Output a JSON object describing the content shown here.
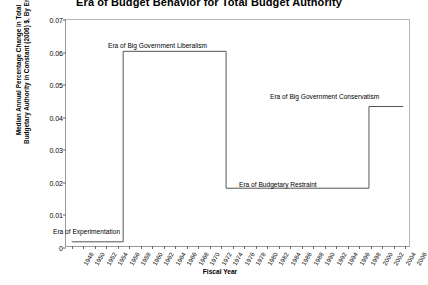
{
  "chart_data": {
    "type": "line",
    "title": "Era of Budget Behavior for Total Budget Authority",
    "xlabel": "Fiscal Year",
    "ylabel": "Median Annual Percentage Change in Total Budgetary Authority in Constant (2006) $, By Era",
    "ylim": [
      0,
      0.07
    ],
    "ytick_labels": [
      "0",
      "0.01",
      "0.02",
      "0.03",
      "0.04",
      "0.05",
      "0.06",
      "0.07"
    ],
    "ytick_values": [
      0,
      0.01,
      0.02,
      0.03,
      0.04,
      0.05,
      0.06,
      0.07
    ],
    "xlim": [
      1947,
      2007
    ],
    "grid": false,
    "legend": "none",
    "line_style": "step",
    "line_color": "#555555",
    "categories": [
      1948,
      1950,
      1952,
      1954,
      1956,
      1958,
      1960,
      1962,
      1964,
      1966,
      1968,
      1970,
      1972,
      1974,
      1976,
      1978,
      1980,
      1982,
      1984,
      1986,
      1988,
      1990,
      1992,
      1994,
      1996,
      1998,
      2000,
      2002,
      2004,
      2006
    ],
    "series": [
      {
        "name": "Median Annual Percentage Change",
        "x": [
          1948,
          1957,
          1957,
          1975,
          1975,
          2000,
          2000,
          2006
        ],
        "values": [
          0.0013,
          0.0013,
          0.0603,
          0.0603,
          0.0179,
          0.0179,
          0.0432,
          0.0432
        ]
      }
    ],
    "eras": [
      {
        "label": "Era of Experimentation",
        "start": 1948,
        "end": 1957,
        "value": 0.0013
      },
      {
        "label": "Era of Big Government Liberalism",
        "start": 1957,
        "end": 1975,
        "value": 0.0603
      },
      {
        "label": "Era of Budgetary Restraint",
        "start": 1975,
        "end": 2000,
        "value": 0.0179
      },
      {
        "label": "Era of Big Government Conservatism",
        "start": 2000,
        "end": 2006,
        "value": 0.0432
      }
    ],
    "annotations": [
      {
        "text": "Era of Experimentation",
        "x_px": 53,
        "y_px": 228
      },
      {
        "text": "Era of Big Government Liberalism",
        "x_px": 108,
        "y_px": 42
      },
      {
        "text": "Era of Budgetary Restraint",
        "x_px": 239,
        "y_px": 181
      },
      {
        "text": "Era of Big Government Conservatism",
        "x_px": 270,
        "y_px": 93
      }
    ]
  }
}
